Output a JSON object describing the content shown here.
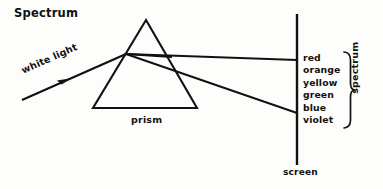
{
  "title": "Spectrum",
  "labels": {
    "white_light": "white light",
    "prism": "prism",
    "screen": "screen",
    "spectrum_bracket": "spectrum"
  },
  "spectrum_colors": [
    "red",
    "orange",
    "yellow",
    "green",
    "blue",
    "violet"
  ],
  "colors": {
    "ink": "#111111",
    "background": "#fdfdfb"
  },
  "geometry": {
    "prism": {
      "apex_x": 146,
      "apex_y": 20,
      "base_left_x": 93,
      "base_right_x": 197,
      "base_y": 108
    },
    "incident_ray": {
      "x1": 22,
      "y1": 100,
      "x2": 126,
      "y2": 54
    },
    "entry_point": {
      "x": 126,
      "y": 54
    },
    "exit_point": {
      "x": 172,
      "y": 57
    },
    "screen": {
      "x": 297,
      "y_top": 14,
      "y_bottom": 165
    },
    "red_ray_screen_y": 60,
    "violet_ray_screen_y": 113,
    "bracket": {
      "x": 347,
      "y_top": 52,
      "y_bottom": 128
    }
  }
}
